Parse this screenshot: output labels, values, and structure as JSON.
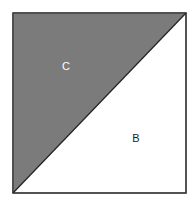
{
  "diagram": {
    "square": {
      "x": 13,
      "y": 13,
      "width": 173,
      "height": 180,
      "stroke": "#333333"
    },
    "regions": [
      {
        "id": "C",
        "label": "C",
        "fill": "#7b7b7b",
        "label_color": "#ffffff",
        "label_x": 66,
        "label_y": 70
      },
      {
        "id": "B",
        "label": "B",
        "fill": "#ffffff",
        "label_color": "#222222",
        "label_x": 136,
        "label_y": 142
      }
    ],
    "diagonal": {
      "from": "bottom-left",
      "to": "top-right"
    }
  }
}
